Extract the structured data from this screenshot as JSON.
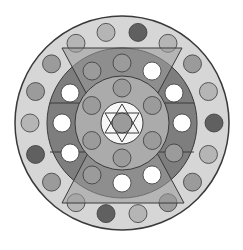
{
  "diagram": {
    "title": "",
    "colors": {
      "background": "#ffffff",
      "outer_ring": "#d6d6d6",
      "middle_band": "#7e7e7e",
      "middle_band_top_bottom": "#9a9a9a",
      "inner_disk": "#ababab",
      "center_disk": "#f7f7f7",
      "stroke": "#3a3a3a",
      "dot_white": "#ffffff",
      "dot_light": "#b5b5b5",
      "dot_mid": "#9b9b9b",
      "dot_dark": "#606060"
    },
    "outer_dots": [
      "dark",
      "light",
      "mid",
      "light",
      "dark",
      "light",
      "mid",
      "mid",
      "light",
      "dark",
      "light",
      "mid",
      "dark",
      "light",
      "mid",
      "mid",
      "light",
      "light"
    ],
    "middle_dots": [
      "mid",
      "white",
      "white",
      "white",
      "mid",
      "white",
      "white",
      "mid",
      "white",
      "white",
      "white",
      "mid"
    ],
    "inner_dots": [
      "mid",
      "mid",
      "mid",
      "mid",
      "mid",
      "mid"
    ],
    "center_dot": "mid"
  }
}
